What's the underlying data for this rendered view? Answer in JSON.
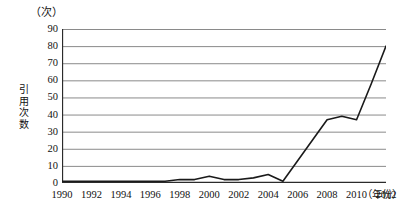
{
  "chart_data": {
    "type": "line",
    "title": "",
    "subtitle": "",
    "xlabel": "(年份)",
    "ylabel": "引用次数",
    "yunit": "(次)",
    "x": [
      1990,
      1991,
      1992,
      1993,
      1994,
      1995,
      1996,
      1997,
      1998,
      1999,
      2000,
      2001,
      2002,
      2003,
      2004,
      2005,
      2006,
      2007,
      2008,
      2009,
      2010,
      2011,
      2012
    ],
    "values": [
      1,
      1,
      1,
      1,
      1,
      1,
      1,
      1,
      2,
      2,
      4,
      2,
      2,
      3,
      5,
      1,
      13,
      25,
      37,
      39,
      37,
      58,
      80
    ],
    "series": [
      {
        "name": "引用次数",
        "values": [
          1,
          1,
          1,
          1,
          1,
          1,
          1,
          1,
          2,
          2,
          4,
          2,
          2,
          3,
          5,
          1,
          13,
          25,
          37,
          39,
          37,
          58,
          80
        ]
      }
    ],
    "xlim": [
      1990,
      2012
    ],
    "ylim": [
      0,
      90
    ],
    "yticks": [
      0,
      10,
      20,
      30,
      40,
      50,
      60,
      70,
      80,
      90
    ],
    "xticks": [
      1990,
      1992,
      1994,
      1996,
      1998,
      2000,
      2002,
      2004,
      2006,
      2008,
      2010,
      2012
    ],
    "grid": true,
    "grid_axis": "y",
    "legend": false,
    "legend_position": "none",
    "line_color": "#1a1a1a",
    "grid_color": "#8a8a8a",
    "axis_color": "#2b2b2b",
    "background": "#ffffff"
  },
  "axes": {
    "y_unit_label": "（次）",
    "y_title_chars": [
      "引",
      "用",
      "次",
      "数"
    ],
    "x_title_label": "（年份）",
    "y_tick_labels": [
      "90",
      "80",
      "70",
      "60",
      "50",
      "40",
      "30",
      "20",
      "10",
      "0"
    ],
    "x_tick_labels": [
      "1990",
      "1992",
      "1994",
      "1996",
      "1998",
      "2000",
      "2002",
      "2004",
      "2006",
      "2008",
      "2010",
      "2012"
    ]
  }
}
